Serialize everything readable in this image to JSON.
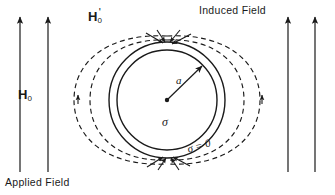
{
  "figure": {
    "width": 335,
    "height": 195,
    "background_color": "#ffffff",
    "stroke_color": "#1a1a1a"
  },
  "labels": {
    "applied_field_symbol": "H",
    "applied_field_subscript": "0",
    "induced_field_symbol": "H",
    "induced_field_subscript": "0",
    "induced_field_prime": "'",
    "induced_field_caption": "Induced Field",
    "applied_field_caption": "Applied Field",
    "radius": "a",
    "conductivity_inside": "σ",
    "conductivity_outside": "σ = 0"
  },
  "geometry": {
    "center_x": 167,
    "center_y": 100,
    "inner_circle_radius": 50,
    "outer_circle_radius": 58,
    "radius_arrow_angle_deg": -45,
    "dashed_lobe_count": 4,
    "applied_arrow_count": 4,
    "applied_arrow_x_positions": [
      20,
      48,
      288,
      315
    ],
    "applied_arrow_top_y": 16,
    "applied_arrow_bottom_y": 172,
    "induced_arrowheads_top": 4,
    "induced_arrowheads_bottom": 4,
    "side_arrowhead_positions": [
      [
        78,
        97
      ],
      [
        262,
        97
      ]
    ]
  },
  "style": {
    "solid_stroke_width": 1.4,
    "dashed_stroke_width": 1.2,
    "dash_pattern": "5 3.5",
    "arrow_stroke_width": 1.2
  }
}
